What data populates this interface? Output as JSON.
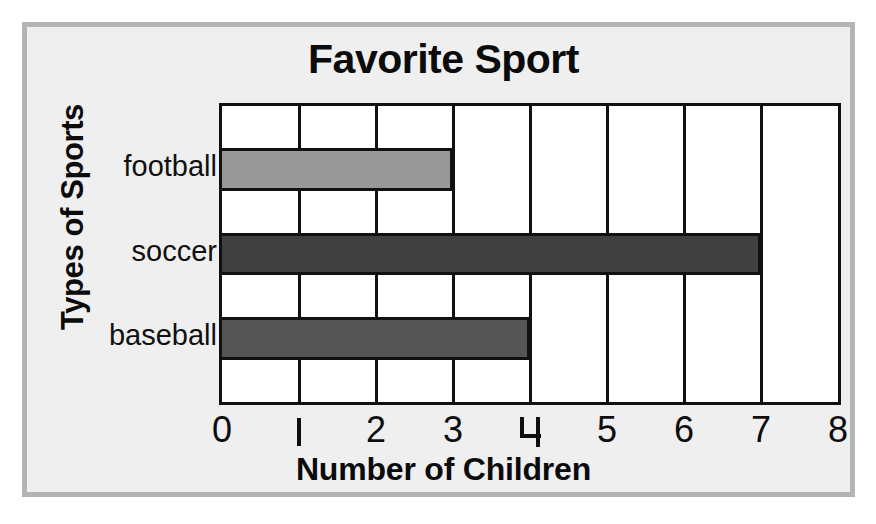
{
  "chart_data": {
    "type": "bar",
    "orientation": "horizontal",
    "title": "Favorite Sport",
    "xlabel": "Number of Children",
    "ylabel": "Types of Sports",
    "categories": [
      "football",
      "soccer",
      "baseball"
    ],
    "values": [
      3,
      7,
      4
    ],
    "bar_colors": [
      "#989898",
      "#404040",
      "#555555"
    ],
    "bar_outline_color": "#111111",
    "xlim": [
      0,
      8
    ],
    "xticks": [
      "0",
      "1",
      "2",
      "3",
      "4",
      "5",
      "6",
      "7",
      "8"
    ],
    "xtick_values": [
      0,
      1,
      2,
      3,
      4,
      5,
      6,
      7,
      8
    ],
    "grid": true,
    "grid_axis": "x",
    "grid_color": "#111111",
    "legend": "none",
    "plot_background": "#ffffff",
    "card_background": "#efefef",
    "card_border_color": "#b4b4b4",
    "text_color": "#0b0b0b",
    "bars": [
      {
        "category": "football",
        "value": 3,
        "color": "#989898"
      },
      {
        "category": "soccer",
        "value": 7,
        "color": "#404040"
      },
      {
        "category": "baseball",
        "value": 4,
        "color": "#555555"
      }
    ]
  }
}
